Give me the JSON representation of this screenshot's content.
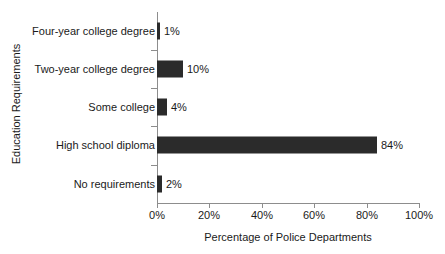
{
  "chart_data": {
    "type": "bar",
    "orientation": "horizontal",
    "title": "",
    "xlabel": "Percentage of Police Departments",
    "ylabel": "Education Requirements",
    "categories": [
      "Four-year college degree",
      "Two-year college degree",
      "Some college",
      "High school diploma",
      "No requirements"
    ],
    "values": [
      1,
      10,
      4,
      84,
      2
    ],
    "value_labels": [
      "1%",
      "10%",
      "4%",
      "84%",
      "2%"
    ],
    "xlim": [
      0,
      100
    ],
    "xticks": [
      0,
      20,
      40,
      60,
      80,
      100
    ],
    "xtick_labels": [
      "0%",
      "20%",
      "40%",
      "60%",
      "80%",
      "100%"
    ],
    "grid": false,
    "legend": false,
    "bar_color": "#2b2b2b",
    "axis_color": "#8d8d8d",
    "text_color": "#1a1a1a"
  }
}
